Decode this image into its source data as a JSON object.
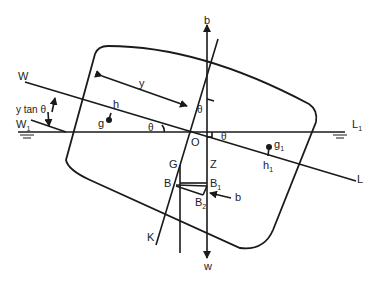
{
  "diagram": {
    "labels": {
      "W": "W",
      "W1": "W",
      "W1_sub": "1",
      "L": "L",
      "L1": "L",
      "L1_sub": "1",
      "y": "y",
      "y_tan_theta": "y tan θ",
      "h": "h",
      "g": "g",
      "g1": "g",
      "g1_sub": "1",
      "h1": "h",
      "h1_sub": "1",
      "theta_left": "θ",
      "theta_right": "θ",
      "theta_top": "θ",
      "O": "O",
      "G": "G",
      "Z": "Z",
      "B": "B",
      "B1": "B",
      "B1_sub": "1",
      "B2": "B",
      "B2_sub": "2",
      "b_top": "b",
      "b_right": "b",
      "w": "w",
      "K": "K"
    },
    "colors": {
      "line": "#1a1a1a",
      "background": "#ffffff"
    }
  }
}
